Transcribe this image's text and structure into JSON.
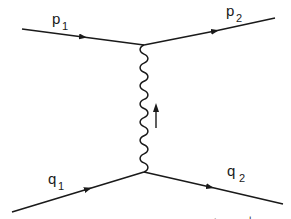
{
  "diagram": {
    "type": "feynman",
    "colors": {
      "ink": "#1a1a1a",
      "background": "#ffffff"
    },
    "labels": {
      "p1": {
        "main": "p",
        "sub": "1"
      },
      "p2": {
        "main": "p",
        "sub": "2"
      },
      "q1": {
        "main": "q",
        "sub": "1"
      },
      "q2": {
        "main": "q",
        "sub": "2"
      }
    },
    "footer_partial": {
      "left": "+",
      "right": "+"
    },
    "lines": [
      {
        "id": "p1",
        "kind": "fermion",
        "from": [
          22,
          29
        ],
        "to": [
          144,
          45
        ]
      },
      {
        "id": "p2",
        "kind": "fermion",
        "from": [
          144,
          45
        ],
        "to": [
          275,
          18
        ]
      },
      {
        "id": "q1",
        "kind": "fermion",
        "from": [
          12,
          212
        ],
        "to": [
          144,
          172
        ]
      },
      {
        "id": "q2",
        "kind": "fermion",
        "from": [
          144,
          172
        ],
        "to": [
          283,
          204
        ]
      },
      {
        "id": "exchange",
        "kind": "photon-wavy",
        "from": [
          144,
          172
        ],
        "to": [
          144,
          45
        ],
        "momentum_arrow": "up"
      }
    ]
  }
}
